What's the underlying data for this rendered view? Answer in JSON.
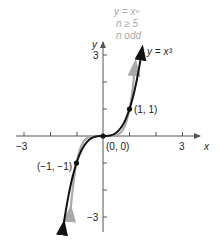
{
  "chart_data": {
    "type": "line",
    "title": "",
    "xlabel": "x",
    "ylabel": "y",
    "xlim": [
      -3,
      3
    ],
    "ylim": [
      -3,
      3
    ],
    "grid": false,
    "x_ticks": [
      -3,
      -2,
      -1,
      0,
      1,
      2,
      3
    ],
    "y_ticks": [
      -3,
      -2,
      -1,
      0,
      1,
      2,
      3
    ],
    "x_tick_labels": {
      "-3": "−3",
      "3": "3"
    },
    "y_tick_labels": {
      "3": "3",
      "-3": "−3"
    },
    "series": [
      {
        "name": "y = x^3",
        "label": "y = x³",
        "color": "#111111",
        "function": "x^3",
        "x_range": [
          -1.48,
          1.48
        ]
      },
      {
        "name": "y = x^n, n ≥ 5, n odd",
        "color": "#a9a9a9",
        "function": "x^5",
        "x_range": [
          -1.22,
          1.22
        ]
      }
    ],
    "points": [
      {
        "x": -1,
        "y": -1,
        "label": "(−1, −1)"
      },
      {
        "x": 0,
        "y": 0,
        "label": "(0, 0)"
      },
      {
        "x": 1,
        "y": 1,
        "label": "(1, 1)"
      }
    ],
    "annotations": [
      "y = xⁿ",
      "n ≥ 5",
      "n odd",
      "y = x³"
    ]
  },
  "labels": {
    "x_axis": "x",
    "y_axis": "y",
    "x_min": "−3",
    "x_max": "3",
    "y_max": "3",
    "y_min": "−3",
    "curve_black": "y = x³",
    "legend_line1": "y = xⁿ",
    "legend_line2": "n ≥ 5",
    "legend_line3": "n odd",
    "point_neg": "(−1, −1)",
    "point_origin": "(0, 0)",
    "point_pos": "(1, 1)"
  },
  "colors": {
    "axis": "#555555",
    "black_curve": "#111111",
    "gray_curve": "#a9a9a9"
  }
}
